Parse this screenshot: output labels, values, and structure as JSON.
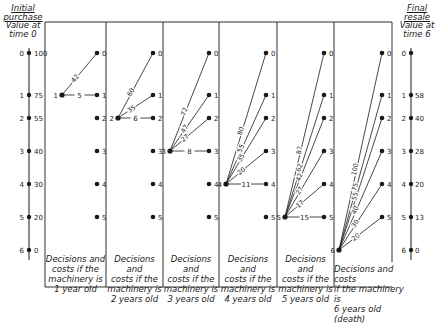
{
  "left_axis": {
    "title_line1": "Initial",
    "title_line2": "purchase",
    "title_line3": "Value at",
    "title_line4": "time 0",
    "nodes": [
      {
        "state": "0",
        "value": "100"
      },
      {
        "state": "1",
        "value": "75"
      },
      {
        "state": "2",
        "value": "55"
      },
      {
        "state": "3",
        "value": "40"
      },
      {
        "state": "4",
        "value": "30"
      },
      {
        "state": "5",
        "value": "20"
      },
      {
        "state": "6",
        "value": "0"
      }
    ]
  },
  "right_axis": {
    "title_line1": "Final",
    "title_line2": "resale",
    "title_line3": "Value at",
    "title_line4": "time 6",
    "nodes": [
      {
        "state": "0",
        "value": ""
      },
      {
        "state": "1",
        "value": "58"
      },
      {
        "state": "2",
        "value": "40"
      },
      {
        "state": "3",
        "value": "28"
      },
      {
        "state": "4",
        "value": "20"
      },
      {
        "state": "5",
        "value": "13"
      },
      {
        "state": "6",
        "value": "0"
      }
    ]
  },
  "panels": [
    {
      "caption_l1": "Decisions and",
      "caption_l2": "costs if the",
      "caption_l3": "machinery is",
      "caption_l4": "1 year old",
      "source": "1",
      "edges": [
        {
          "to": "0",
          "cost": "42"
        },
        {
          "to": "1",
          "cost": "5"
        }
      ]
    },
    {
      "caption_l1": "Decisions and",
      "caption_l2": "costs if the",
      "caption_l3": "machinery is",
      "caption_l4": "2 years old",
      "source": "2",
      "edges": [
        {
          "to": "0",
          "cost": "60"
        },
        {
          "to": "1",
          "cost": "35"
        },
        {
          "to": "2",
          "cost": "6"
        }
      ]
    },
    {
      "caption_l1": "Decisions and",
      "caption_l2": "costs if the",
      "caption_l3": "machinery is",
      "caption_l4": "3 years old",
      "source": "3",
      "edges": [
        {
          "to": "0",
          "cost": "72"
        },
        {
          "to": "1",
          "cost": "47"
        },
        {
          "to": "2",
          "cost": "27"
        },
        {
          "to": "3",
          "cost": "8"
        }
      ]
    },
    {
      "caption_l1": "Decisions and",
      "caption_l2": "costs if the",
      "caption_l3": "machinery is",
      "caption_l4": "4 years old",
      "source": "4",
      "edges": [
        {
          "to": "0",
          "cost": "80"
        },
        {
          "to": "1",
          "cost": "55"
        },
        {
          "to": "2",
          "cost": "35"
        },
        {
          "to": "3",
          "cost": "20"
        },
        {
          "to": "4",
          "cost": "11"
        }
      ]
    },
    {
      "caption_l1": "Decisions and",
      "caption_l2": "costs if the",
      "caption_l3": "machinery is",
      "caption_l4": "5 years old",
      "source": "5",
      "edges": [
        {
          "to": "0",
          "cost": "87"
        },
        {
          "to": "1",
          "cost": "62"
        },
        {
          "to": "2",
          "cost": "42"
        },
        {
          "to": "3",
          "cost": "27"
        },
        {
          "to": "4",
          "cost": "17"
        },
        {
          "to": "5",
          "cost": "15"
        }
      ]
    },
    {
      "caption_l1": "Decisions and costs",
      "caption_l2": "if the machinery is",
      "caption_l3": "6 years old (death)",
      "caption_l4": "",
      "source": "6",
      "edges": [
        {
          "to": "0",
          "cost": "100"
        },
        {
          "to": "1",
          "cost": "75"
        },
        {
          "to": "2",
          "cost": "55"
        },
        {
          "to": "3",
          "cost": "40"
        },
        {
          "to": "4",
          "cost": "30"
        },
        {
          "to": "5",
          "cost": "20"
        }
      ]
    }
  ],
  "node_labels": [
    "0",
    "1",
    "2",
    "3",
    "4",
    "5",
    "6"
  ]
}
